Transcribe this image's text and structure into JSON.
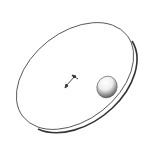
{
  "diagram": {
    "type": "illustration",
    "elements": [
      {
        "id": "disc",
        "shape": "tilted ellipse",
        "description": "flat disc outline"
      },
      {
        "id": "vector",
        "shape": "small arrow at disc center",
        "description": "short double-ended vector"
      },
      {
        "id": "ball",
        "shape": "shaded sphere",
        "description": "sphere resting near right edge of disc"
      }
    ]
  },
  "colors": {
    "background": "#ffffff",
    "outline": "#333333",
    "ball_light": "#ffffff",
    "ball_dark": "#555555"
  },
  "icons": {
    "disc": "disc-outline-icon",
    "vector": "arrow-vector-icon",
    "ball": "sphere-icon"
  }
}
